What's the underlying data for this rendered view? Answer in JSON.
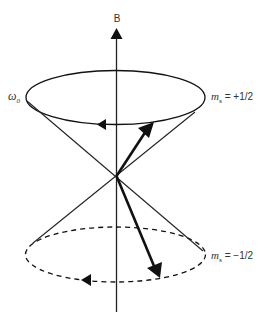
{
  "figure": {
    "axis_label": "B",
    "frequency_label": {
      "symbol": "ω",
      "subscript": "0"
    },
    "states": [
      {
        "symbol": "m",
        "subscript": "s",
        "value": " = +1/2",
        "position": "upper cone"
      },
      {
        "symbol": "m",
        "subscript": "s",
        "value": " = −1/2",
        "position": "lower cone"
      }
    ],
    "colors": {
      "stroke": "#111111",
      "text": "#333333",
      "background": "#ffffff"
    }
  }
}
